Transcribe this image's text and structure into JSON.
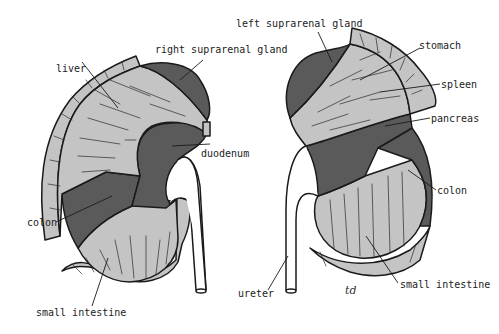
{
  "figure": {
    "colors": {
      "background": "#ffffff",
      "dark_region": "#5a5a5a",
      "light_region": "#c4c4c4",
      "outline": "#1a1a1a"
    },
    "right_kidney": {
      "labels": {
        "liver": "liver",
        "suprarenal": "right suprarenal gland",
        "duodenum": "duodenum",
        "colon": "colon",
        "small_intestine": "small intestine"
      }
    },
    "left_kidney": {
      "labels": {
        "suprarenal": "left suprarenal gland",
        "stomach": "stomach",
        "spleen": "spleen",
        "pancreas": "pancreas",
        "colon": "colon",
        "small_intestine": "small intestine",
        "ureter": "ureter"
      }
    },
    "signature": "td"
  }
}
